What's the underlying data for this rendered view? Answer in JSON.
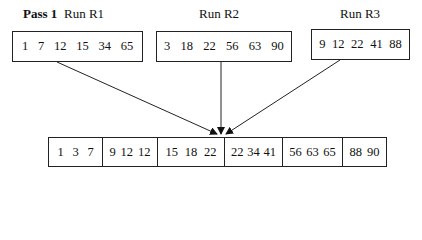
{
  "header": {
    "pass_label": "Pass 1",
    "runs": [
      {
        "label": "Run R1",
        "values": [
          "1",
          "7",
          "12",
          "15",
          "34",
          "65"
        ]
      },
      {
        "label": "Run R2",
        "values": [
          "3",
          "18",
          "22",
          "56",
          "63",
          "90"
        ]
      },
      {
        "label": "Run R3",
        "values": [
          "9",
          "12",
          "22",
          "41",
          "88"
        ]
      }
    ]
  },
  "output": {
    "blocks": [
      [
        "1",
        "3",
        "7"
      ],
      [
        "9",
        "12",
        "12"
      ],
      [
        "15",
        "18",
        "22"
      ],
      [
        "22",
        "34",
        "41"
      ],
      [
        "56",
        "63",
        "65"
      ],
      [
        "88",
        "90"
      ]
    ]
  },
  "colors": {
    "line": "#222222",
    "background": "#ffffff"
  }
}
